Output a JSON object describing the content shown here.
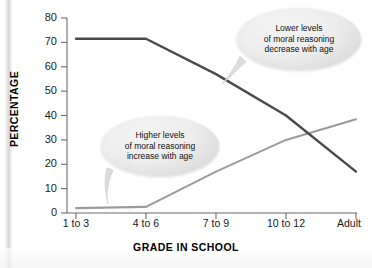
{
  "chart_data": {
    "type": "line",
    "title": "",
    "xlabel": "GRADE IN SCHOOL",
    "ylabel": "PERCENTAGE",
    "categories": [
      "1 to 3",
      "4 to 6",
      "7 to 9",
      "10 to 12",
      "Adult"
    ],
    "ylim": [
      0,
      80
    ],
    "yticks": [
      0,
      10,
      20,
      30,
      40,
      50,
      60,
      70,
      80
    ],
    "grid": false,
    "legend": "none",
    "series": [
      {
        "name": "Lower levels of moral reasoning",
        "color": "#4a4a4a",
        "values": [
          71.5,
          71.5,
          57,
          40,
          17
        ]
      },
      {
        "name": "Higher levels of moral reasoning",
        "color": "#9b9b9b",
        "values": [
          2,
          2.5,
          17,
          30,
          38.5
        ]
      }
    ],
    "annotations": [
      {
        "id": "upper",
        "lines": [
          "Lower levels",
          "of moral reasoning",
          "decrease with age"
        ],
        "points_to_series": "Lower levels of moral reasoning"
      },
      {
        "id": "lower",
        "lines": [
          "Higher levels",
          "of moral reasoning",
          "increase with age"
        ],
        "points_to_series": "Higher levels of moral reasoning"
      }
    ]
  },
  "axis": {
    "y_tick_labels": [
      "80",
      "70",
      "60",
      "50",
      "40",
      "30",
      "20",
      "10",
      "0"
    ],
    "x_tick_labels": [
      "1 to 3",
      "4 to 6",
      "7 to 9",
      "10 to 12",
      "Adult"
    ],
    "x_title": "GRADE IN SCHOOL",
    "y_title": "PERCENTAGE"
  },
  "callouts": {
    "upper": {
      "line1": "Lower levels",
      "line2": "of moral reasoning",
      "line3": "decrease with age"
    },
    "lower": {
      "line1": "Higher levels",
      "line2": "of moral reasoning",
      "line3": "increase with age"
    }
  },
  "colors": {
    "series_dark": "#4a4a4a",
    "series_light": "#9b9b9b",
    "axis": "#6b6b6b",
    "text": "#111111"
  }
}
